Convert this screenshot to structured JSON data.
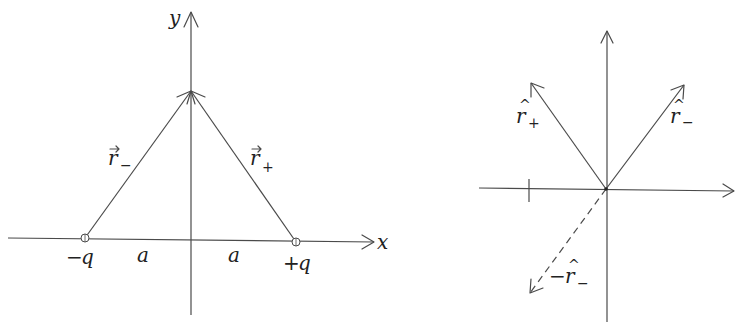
{
  "left_diagram": {
    "axis_x_label": "x",
    "axis_y_label": "y",
    "charge_left": {
      "sign": "−",
      "symbol": "q"
    },
    "charge_right": {
      "sign": "+",
      "symbol": "q"
    },
    "dist_left": "a",
    "dist_right": "a",
    "vector_left": {
      "symbol": "r",
      "accent": "⃗",
      "sub": "−"
    },
    "vector_right": {
      "symbol": "r",
      "accent": "⃗",
      "sub": "+"
    }
  },
  "right_diagram": {
    "unit_plus": {
      "symbol": "r",
      "hat": "^",
      "sub": "+"
    },
    "unit_minus": {
      "symbol": "r",
      "hat": "^",
      "sub": "−"
    },
    "neg_unit_minus": {
      "prefix": "−",
      "symbol": "r",
      "hat": "^",
      "sub": "−"
    }
  },
  "colors": {
    "line": "#4a4a4a",
    "text": "#222222",
    "background": "#ffffff"
  }
}
